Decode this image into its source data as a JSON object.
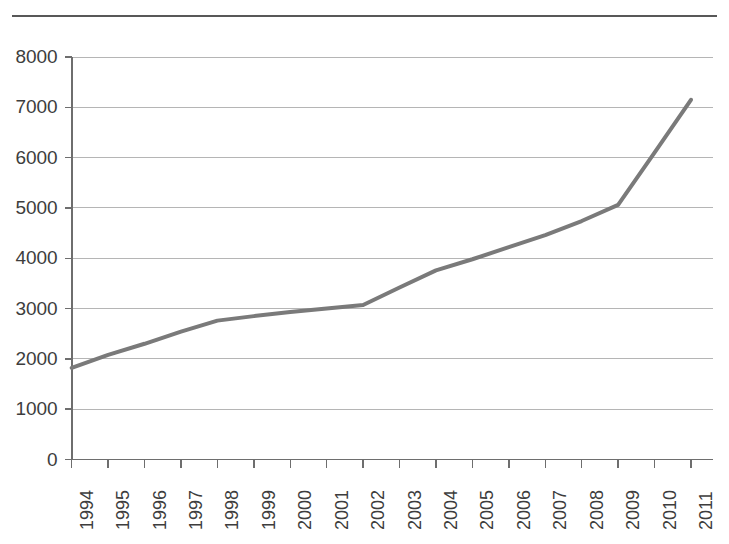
{
  "chart_data": {
    "type": "line",
    "title": "",
    "subtitle": "",
    "xlabel": "",
    "ylabel": "",
    "grid": true,
    "legend": false,
    "legend_position": "none",
    "line_color": "#7a7a7a",
    "grid_color": "#b5b5b5",
    "axis_color": "#6e6e6e",
    "x": [
      "1994",
      "1995",
      "1996",
      "1997",
      "1998",
      "1999",
      "2000",
      "2001",
      "2002",
      "2003",
      "2004",
      "2005",
      "2006",
      "2007",
      "2008",
      "2009",
      "2010",
      "2011"
    ],
    "values": [
      1820,
      2080,
      2300,
      2540,
      2760,
      2850,
      2930,
      3000,
      3070,
      3420,
      3760,
      3980,
      4220,
      4460,
      4740,
      5060,
      6100,
      7150
    ],
    "ytick_labels": [
      "8000",
      "7000",
      "6000",
      "5000",
      "4000",
      "3000",
      "2000",
      "1000",
      "0"
    ],
    "ytick_values": [
      8000,
      7000,
      6000,
      5000,
      4000,
      3000,
      2000,
      1000,
      0
    ],
    "ylim": [
      0,
      8000
    ],
    "ystep": 1000,
    "xtick_labels": [
      "1994",
      "1995",
      "1996",
      "1997",
      "1998",
      "1999",
      "2000",
      "2001",
      "2002",
      "2003",
      "2004",
      "2005",
      "2006",
      "2007",
      "2008",
      "2009",
      "2010",
      "2011"
    ],
    "annotations": []
  },
  "layout": {
    "plot_left": 71.7,
    "plot_right": 713,
    "plot_top": 57,
    "plot_bottom": 459.5,
    "x_spacing": 37.6,
    "y_per_unit": 0.0503,
    "top_rule": true
  }
}
